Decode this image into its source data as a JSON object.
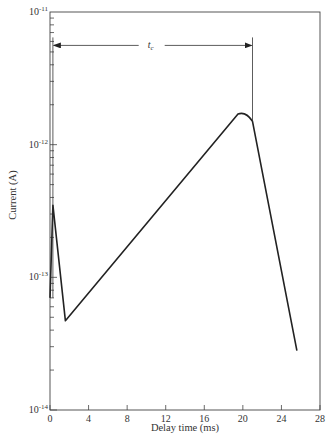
{
  "chart_data": {
    "type": "line",
    "title": "",
    "xlabel": "Delay time (ms)",
    "ylabel": "Current (A)",
    "xscale": "linear",
    "yscale": "log",
    "xlim": [
      0,
      28
    ],
    "ylim": [
      1e-14,
      1e-11
    ],
    "grid": false,
    "legend": null,
    "x_ticks": [
      0,
      4,
      8,
      12,
      16,
      20,
      24,
      28
    ],
    "x_tick_labels": [
      "0",
      "4",
      "8",
      "12",
      "16",
      "20",
      "24",
      "28"
    ],
    "y_ticks": [
      1e-14,
      1e-13,
      1e-12,
      1e-11
    ],
    "y_tick_labels": [
      {
        "base": "10",
        "exp": "-14"
      },
      {
        "base": "10",
        "exp": "-13"
      },
      {
        "base": "10",
        "exp": "-12"
      },
      {
        "base": "10",
        "exp": "-11"
      }
    ],
    "series": [
      {
        "name": "Current",
        "color": "#222222",
        "x": [
          0.0,
          0.3,
          1.6,
          19.5,
          20.3,
          21.0,
          25.6
        ],
        "y": [
          7e-14,
          3.5e-13,
          4.7e-14,
          1.7e-12,
          1.7e-12,
          1.5e-12,
          2.8e-14
        ]
      }
    ],
    "annotations": [
      {
        "type": "double-arrow",
        "label": "t_c",
        "label_main": "t",
        "label_sub": "c",
        "x_start": 0.3,
        "x_end": 21.0,
        "y": 5.6e-12
      }
    ]
  }
}
